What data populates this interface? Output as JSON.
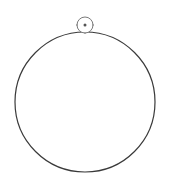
{
  "canvas": {
    "width": 170,
    "height": 190,
    "background": "#ffffff"
  },
  "shape": {
    "type": "circle",
    "cx": 85,
    "cy": 102,
    "r": 70,
    "stroke": "#3a3a3a",
    "fill": "none"
  },
  "rotation_handle": {
    "icon": "rotate-handle-icon",
    "cx": 85,
    "cy": 25,
    "r": 8,
    "stroke": "#7a7a7a",
    "dot_color": "#555555"
  }
}
